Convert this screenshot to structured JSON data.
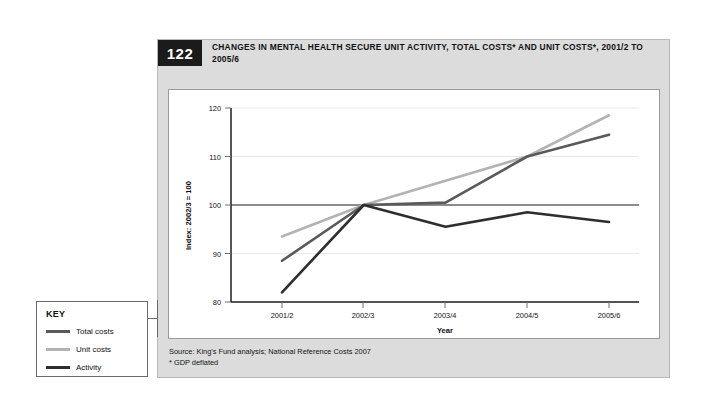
{
  "figure": {
    "number": "122",
    "title": "CHANGES IN MENTAL HEALTH SECURE UNIT ACTIVITY, TOTAL COSTS* AND UNIT COSTS*, 2001/2 TO 2005/6",
    "source_line": "Source: King's Fund analysis; National Reference Costs 2007",
    "footnote_line": "* GDP deflated"
  },
  "key": {
    "title": "KEY",
    "items": [
      {
        "label": "Total costs",
        "color": "#5a5a5a"
      },
      {
        "label": "Unit costs",
        "color": "#b3b3b3"
      },
      {
        "label": "Activity",
        "color": "#2e2e2e"
      }
    ]
  },
  "chart_data": {
    "type": "line",
    "title": "CHANGES IN MENTAL HEALTH SECURE UNIT ACTIVITY, TOTAL COSTS* AND UNIT COSTS*, 2001/2 TO 2005/6",
    "categories": [
      "2001/2",
      "2002/3",
      "2003/4",
      "2004/5",
      "2005/6"
    ],
    "series": [
      {
        "name": "Total costs",
        "color": "#5a5a5a",
        "values": [
          88.5,
          100,
          100.5,
          110,
          114.5
        ]
      },
      {
        "name": "Unit costs",
        "color": "#b3b3b3",
        "values": [
          93.5,
          100,
          105,
          110,
          118.5
        ]
      },
      {
        "name": "Activity",
        "color": "#2e2e2e",
        "values": [
          82,
          100,
          95.5,
          98.5,
          96.5
        ]
      }
    ],
    "xlabel": "Year",
    "ylabel": "Index: 2002/3 = 100",
    "ylim": [
      80,
      120
    ],
    "yticks": [
      80,
      90,
      100,
      110,
      120
    ],
    "grid": true,
    "legend_position": "external-left",
    "reference_line": 100
  },
  "axis": {
    "y_ticks": [
      "80",
      "90",
      "100",
      "110",
      "120"
    ],
    "x_ticks": [
      "2001/2",
      "2002/3",
      "2003/4",
      "2004/5",
      "2005/6"
    ],
    "x_title": "Year",
    "y_title": "Index: 2002/3 = 100"
  }
}
